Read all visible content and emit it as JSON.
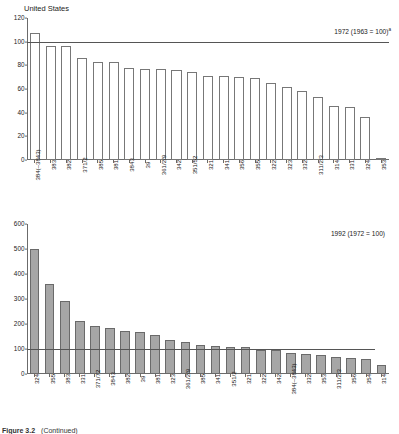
{
  "figure": {
    "caption_number": "Figure 3.2",
    "caption_text": "(Continued)"
  },
  "chart_data": [
    {
      "id": "top",
      "type": "bar",
      "title": "United States",
      "annotation": "1972 (1963 = 100)",
      "annotation_superscript": "a",
      "xlabel": "",
      "ylabel": "",
      "ylim": [
        0,
        120
      ],
      "yticks": [
        0,
        20,
        40,
        60,
        80,
        100,
        120
      ],
      "grid": false,
      "reference_line": 100,
      "bar_style": "hollow",
      "categories": [
        "384(–3843)",
        "383",
        "382",
        "371/2",
        "385",
        "381",
        "3843",
        "39",
        "361/2/9",
        "342",
        "351/52",
        "321",
        "341",
        "356",
        "355",
        "322",
        "323",
        "332",
        "311/2/3",
        "314",
        "331",
        "324",
        "353"
      ],
      "values": [
        107,
        96,
        96,
        86,
        83,
        83,
        78,
        77,
        77,
        76,
        74,
        71,
        71,
        70,
        69,
        65,
        62,
        58,
        53,
        46,
        45,
        36,
        1
      ]
    },
    {
      "id": "bottom",
      "type": "bar",
      "title": "",
      "annotation": "1992 (1972 = 100)",
      "annotation_superscript": "",
      "xlabel": "",
      "ylabel": "",
      "ylim": [
        0,
        600
      ],
      "yticks": [
        0,
        100,
        200,
        300,
        400,
        500,
        600
      ],
      "grid": false,
      "reference_line": 100,
      "bar_style": "filled",
      "categories": [
        "324",
        "355",
        "383",
        "331",
        "371/72",
        "3843",
        "382",
        "39",
        "381",
        "323",
        "361/2/9",
        "385",
        "341",
        "351/2",
        "321",
        "322",
        "342",
        "384(–3843)",
        "332",
        "353",
        "311/2/3",
        "356",
        "354",
        "314"
      ],
      "values": [
        500,
        362,
        293,
        214,
        193,
        186,
        173,
        170,
        157,
        136,
        129,
        116,
        112,
        110,
        110,
        98,
        95,
        84,
        79,
        78,
        67,
        66,
        61,
        38
      ]
    }
  ]
}
